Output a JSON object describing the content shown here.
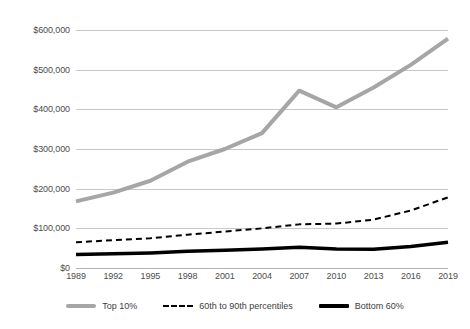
{
  "chart_data": {
    "type": "line",
    "title": "Average Family Wealth by Percentile, 1989–2019",
    "xlabel": "",
    "ylabel": "",
    "x": [
      1989,
      1992,
      1995,
      1998,
      2001,
      2004,
      2007,
      2010,
      2013,
      2016,
      2019
    ],
    "tick_labels": [
      "1989",
      "1992",
      "1995",
      "1998",
      "2001",
      "2004",
      "2007",
      "2010",
      "2013",
      "2016",
      "2019"
    ],
    "xlim": [
      1989,
      2019
    ],
    "ylim": [
      0,
      600000
    ],
    "y_ticks": [
      0,
      100000,
      200000,
      300000,
      400000,
      500000,
      600000
    ],
    "y_tick_labels": [
      "$0",
      "$100,000",
      "$200,000",
      "$300,000",
      "$400,000",
      "$500,000",
      "$600,000"
    ],
    "grid": true,
    "legend_position": "bottom",
    "series": [
      {
        "name": "Top 10%",
        "style": "solid",
        "color": "#A6A6A6",
        "width": 4,
        "values": [
          168000,
          190000,
          220000,
          268000,
          300000,
          340000,
          447000,
          405000,
          455000,
          512000,
          578000
        ]
      },
      {
        "name": "60th to 90th percentiles",
        "style": "dashed",
        "color": "#000000",
        "width": 2,
        "values": [
          65000,
          70000,
          75000,
          84000,
          92000,
          100000,
          110000,
          112000,
          122000,
          145000,
          178000
        ]
      },
      {
        "name": "Bottom 60%",
        "style": "solid",
        "color": "#000000",
        "width": 3.5,
        "values": [
          34000,
          36000,
          38000,
          42000,
          45000,
          48000,
          52000,
          48000,
          47000,
          54000,
          65000
        ]
      }
    ]
  },
  "legend": {
    "items": [
      {
        "label": "Top 10%",
        "swatch": "solid-gray-line-swatch"
      },
      {
        "label": "60th to 90th percentiles",
        "swatch": "dashed-black-line-swatch"
      },
      {
        "label": "Bottom 60%",
        "swatch": "solid-black-line-swatch"
      }
    ]
  }
}
